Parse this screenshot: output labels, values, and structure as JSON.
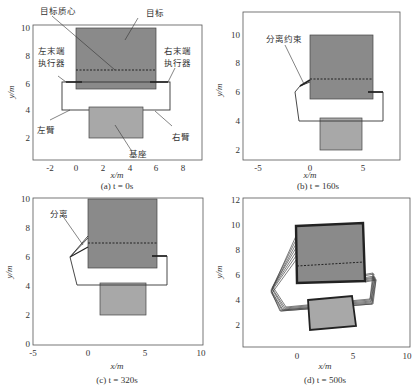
{
  "figure": {
    "panels": [
      {
        "id": "a",
        "caption": "(a) t = 0s",
        "xlabel": "x/m",
        "ylabel": "y/m",
        "xticks": [
          "-2",
          "0",
          "2",
          "4",
          "6",
          "8"
        ],
        "yticks": [
          "10",
          "8",
          "6",
          "4",
          "2"
        ],
        "annotations": {
          "target_centroid": "目标质心",
          "target": "目标",
          "left_end_effector_1": "左末端",
          "left_end_effector_2": "执行器",
          "right_end_effector_1": "右末端",
          "right_end_effector_2": "执行器",
          "left_arm": "左臂",
          "right_arm": "右臂",
          "base": "基座"
        }
      },
      {
        "id": "b",
        "caption": "(b) t = 160s",
        "xlabel": "x/m",
        "ylabel": "y/m",
        "xticks": [
          "-5",
          "0",
          "5"
        ],
        "yticks": [
          "10",
          "8",
          "6",
          "4",
          "2"
        ],
        "annotations": {
          "separation_constraint": "分离约束"
        }
      },
      {
        "id": "c",
        "caption": "(c) t = 320s",
        "xlabel": "x/m",
        "ylabel": "y/m",
        "xticks": [
          "-5",
          "0",
          "5",
          "10"
        ],
        "yticks": [
          "10",
          "8",
          "6",
          "4",
          "2",
          "0"
        ],
        "annotations": {
          "separation": "分离"
        }
      },
      {
        "id": "d",
        "caption": "(d) t = 500s",
        "xlabel": "x/m",
        "ylabel": "y/m",
        "xticks": [
          "0",
          "5",
          "10"
        ],
        "yticks": [
          "12",
          "10",
          "8",
          "6",
          "4",
          "2"
        ],
        "annotations": {}
      }
    ],
    "colors": {
      "target_fill": "#8a8a8a",
      "base_fill": "#a8a8a8",
      "line": "#333333",
      "axis": "#555555"
    }
  }
}
